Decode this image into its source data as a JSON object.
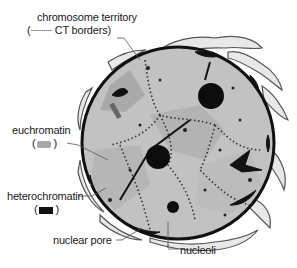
{
  "diagram": {
    "labels": {
      "chromosome_territory": "chromosome territory",
      "ct_borders_open": "(",
      "ct_borders_dash": "----------",
      "ct_borders_text": "CT borders)",
      "euchromatin": "euchromatin",
      "euchromatin_legend_open": "(",
      "euchromatin_legend_close": ")",
      "heterochromatin": "heterochromatin",
      "heterochromatin_legend_open": "(",
      "heterochromatin_legend_close": ")",
      "nuclear_pore": "nuclear pore",
      "nucleoli": "nucleoli"
    },
    "colors": {
      "background": "#ffffff",
      "nucleoplasm": "#bdbdbd",
      "euchromatin": "#a8a8a8",
      "heterochromatin": "#111111",
      "envelope_er": "#e6e6e6",
      "outline": "#3a3a3a"
    }
  }
}
